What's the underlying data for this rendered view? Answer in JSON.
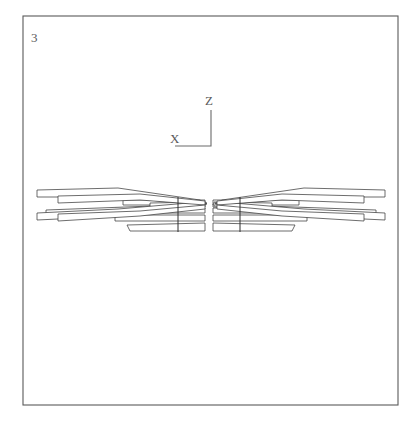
{
  "view": {
    "label": "3",
    "background_color": "#ffffff",
    "line_color": "#3c3c3c",
    "frame_color": "#5a5a5a",
    "frame": {
      "x": 23,
      "y": 16,
      "width": 375,
      "height": 389
    }
  },
  "axis_indicator": {
    "name": "axis-triad",
    "z_label": "Z",
    "x_label": "X",
    "corner": {
      "x": 211,
      "y": 146
    },
    "vertical_top": {
      "x": 211,
      "y": 110
    },
    "horizontal_left": {
      "x": 175,
      "y": 146
    },
    "z_label_pos": {
      "x": 205,
      "y": 105
    },
    "x_label_pos": {
      "x": 170,
      "y": 143
    }
  },
  "model": {
    "name": "rotor-assembly-edge-view",
    "description": "Multi-blade rotor assembly viewed edge-on in the X-Z plane",
    "center_gap": {
      "left": 205,
      "right": 213
    },
    "hub_ticks_x": [
      178,
      240
    ],
    "hub_tick_span_y": [
      197,
      232
    ],
    "blade_sets": [
      {
        "name": "upper-left-blade",
        "points": "37,190 118,188 200,200 207,204 200,205 120,197 37,197"
      },
      {
        "name": "lower-left-blade",
        "points": "37,220 120,216 200,206 207,203 200,202 118,209 37,213"
      },
      {
        "name": "upper-right-blade",
        "points": "385,190 304,188 222,200 215,204 222,205 302,197 385,197"
      },
      {
        "name": "lower-right-blade",
        "points": "385,220 302,216 222,206 215,203 222,202 304,209 385,213"
      },
      {
        "name": "mid-upper-left-blade",
        "points": "58,196 140,194 205,201 205,205 140,200 58,203"
      },
      {
        "name": "mid-upper-right-blade",
        "points": "364,196 282,194 217,201 217,205 282,200 364,203"
      },
      {
        "name": "mid-lower-left-blade",
        "points": "58,214 140,211 205,205 205,209 140,216 58,221"
      },
      {
        "name": "mid-lower-right-blade",
        "points": "364,214 282,211 217,205 217,209 282,216 364,221"
      }
    ],
    "bars_left": [
      {
        "name": "bar-left-1",
        "points": "123,200 205,200 205,205 123,205"
      },
      {
        "name": "bar-left-2",
        "points": "115,208 205,208 205,213 115,213"
      },
      {
        "name": "bar-left-3",
        "points": "115,215 205,215 205,221 115,221"
      },
      {
        "name": "bar-left-4",
        "points": "127,225 205,223 205,231 130,231"
      }
    ],
    "bars_right": [
      {
        "name": "bar-right-1",
        "points": "299,200 213,200 213,205 299,205"
      },
      {
        "name": "bar-right-2",
        "points": "307,208 213,208 213,213 307,213"
      },
      {
        "name": "bar-right-3",
        "points": "307,215 213,215 213,221 307,221"
      },
      {
        "name": "bar-right-4",
        "points": "295,225 213,223 213,231 292,231"
      }
    ],
    "spine_left": {
      "name": "spine-left",
      "points": "46,210 205,204 205,207 46,214"
    },
    "spine_right": {
      "name": "spine-right",
      "points": "376,210 213,204 213,207 376,214"
    },
    "detail_left": {
      "name": "detail-left",
      "points": "150,203 204,202 204,206 150,207"
    },
    "detail_right": {
      "name": "detail-right",
      "points": "272,203 214,202 214,206 272,207"
    }
  }
}
